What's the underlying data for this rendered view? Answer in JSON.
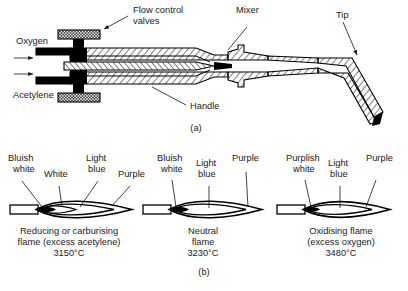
{
  "figure": {
    "title_a": "(a)",
    "title_b": "(b)",
    "panel_a": {
      "labels": {
        "oxygen": "Oxygen",
        "acetylene": "Acetylene",
        "flow_control_valves_line1": "Flow control",
        "flow_control_valves_line2": "valves",
        "mixer": "Mixer",
        "tip": "Tip",
        "handle": "Handle"
      }
    },
    "panel_b": {
      "flames": [
        {
          "id": "reducing-flame",
          "zone_labels": [
            {
              "key": "inner-cone",
              "text_line1": "Bluish",
              "text_line2": "white"
            },
            {
              "key": "acetylene-feather",
              "text_line1": "White",
              "text_line2": ""
            },
            {
              "key": "middle-zone",
              "text_line1": "Light",
              "text_line2": "blue"
            },
            {
              "key": "outer-envelope",
              "text_line1": "Purple",
              "text_line2": ""
            }
          ],
          "caption_line1": "Reducing or carburising",
          "caption_line2": "flame (excess acetylene)",
          "temperature": "3150°C"
        },
        {
          "id": "neutral-flame",
          "zone_labels": [
            {
              "key": "inner-cone",
              "text_line1": "Bluish",
              "text_line2": "white"
            },
            {
              "key": "middle-zone",
              "text_line1": "Light",
              "text_line2": "blue"
            },
            {
              "key": "outer-envelope",
              "text_line1": "Purple",
              "text_line2": ""
            }
          ],
          "caption_line1": "Neutral",
          "caption_line2": "flame",
          "temperature": "3230°C"
        },
        {
          "id": "oxidising-flame",
          "zone_labels": [
            {
              "key": "inner-cone",
              "text_line1": "Purplish",
              "text_line2": "white"
            },
            {
              "key": "middle-zone",
              "text_line1": "Light",
              "text_line2": "blue"
            },
            {
              "key": "outer-envelope",
              "text_line1": "Purple",
              "text_line2": ""
            }
          ],
          "caption_line1": "Oxidising flame",
          "caption_line2": "(excess oxygen)",
          "temperature": "3480°C"
        }
      ]
    },
    "colors": {
      "ink": "#000000",
      "text": "#1a1a1a",
      "background": "#ffffff"
    }
  }
}
